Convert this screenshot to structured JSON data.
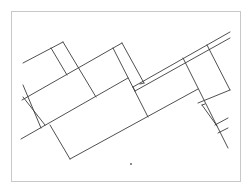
{
  "diagram": {
    "type": "line-drawing",
    "background": "#ffffff",
    "frame": {
      "x": 11,
      "y": 11,
      "w": 229,
      "h": 170,
      "stroke": "#c8c8c8"
    },
    "stroke": "#3c3c3c",
    "segments": [
      [
        23,
        63,
        63,
        42
      ],
      [
        63,
        42,
        96,
        97
      ],
      [
        51,
        48,
        67,
        75
      ],
      [
        22,
        100,
        122,
        43
      ],
      [
        122,
        43,
        144,
        83
      ],
      [
        113,
        48,
        148,
        117
      ],
      [
        21,
        139,
        128,
        78
      ],
      [
        23,
        85,
        41,
        128
      ],
      [
        23,
        97,
        45,
        125
      ],
      [
        50,
        125,
        70,
        159
      ],
      [
        70,
        159,
        198,
        89
      ],
      [
        133,
        87,
        230,
        32
      ],
      [
        135,
        91,
        230,
        38
      ],
      [
        133,
        87,
        135,
        91
      ],
      [
        140,
        84,
        144,
        83
      ],
      [
        183,
        58,
        228,
        148
      ],
      [
        207,
        45,
        230,
        90
      ],
      [
        198,
        103,
        230,
        90
      ],
      [
        202,
        105,
        217,
        126
      ],
      [
        202,
        105,
        205,
        104
      ],
      [
        215,
        125,
        228,
        118
      ],
      [
        218,
        133,
        228,
        128
      ]
    ],
    "dots": [
      {
        "x": 131,
        "y": 164,
        "r": 0.9
      }
    ]
  }
}
